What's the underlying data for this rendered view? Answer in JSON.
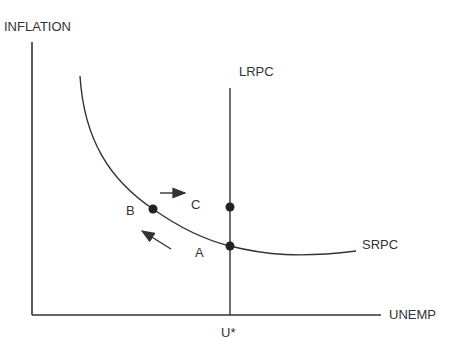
{
  "diagram": {
    "axes": {
      "y_label": "INFLATION",
      "x_label": "UNEMP",
      "x_tick": "U*"
    },
    "curves": {
      "srpc_label": "SRPC",
      "lrpc_label": "LRPC"
    },
    "points": {
      "a": "A",
      "b": "B",
      "c": "C"
    },
    "arrows": {
      "right_arrow": "movement toward C",
      "up_left_arrow": "movement from A toward B"
    },
    "colors": {
      "line": "#333333",
      "text": "#333333",
      "background": "#ffffff"
    }
  }
}
